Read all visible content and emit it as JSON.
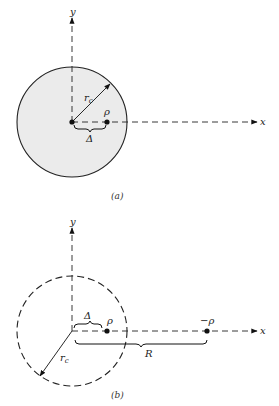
{
  "figure_a": {
    "caption": "(a)",
    "y_axis_label": "y",
    "x_axis_label": "x",
    "radius_label": "r",
    "radius_subscript": "c",
    "charge_label": "ρ",
    "offset_label": "Δ",
    "circle_style": "solid, shaded",
    "fill_color": "#ebebeb"
  },
  "figure_b": {
    "caption": "(b)",
    "y_axis_label": "y",
    "x_axis_label": "x",
    "radius_label": "r",
    "radius_subscript": "c",
    "charge_label": "ρ",
    "image_charge_label": "−ρ",
    "offset_label": "Δ",
    "distance_label": "R",
    "circle_style": "dashed"
  }
}
